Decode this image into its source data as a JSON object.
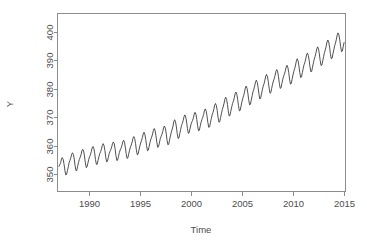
{
  "chart_data": {
    "type": "line",
    "title": "",
    "xlabel": "Time",
    "ylabel": "Y",
    "xlim": [
      1986.9,
      2015.1
    ],
    "ylim": [
      344.0,
      406.5
    ],
    "grid": false,
    "legend": null,
    "x_ticks": [
      1990,
      1995,
      2000,
      2005,
      2010,
      2015
    ],
    "x_tick_labels": [
      "1990",
      "1995",
      "2000",
      "2005",
      "2010",
      "2015"
    ],
    "y_ticks": [
      350,
      360,
      370,
      380,
      390,
      400
    ],
    "y_tick_labels": [
      "350",
      "360",
      "370",
      "380",
      "390",
      "400"
    ],
    "series": [
      {
        "name": "Y",
        "color": "#3d3d3d",
        "x": [
          1987.04,
          1987.12,
          1987.21,
          1987.29,
          1987.37,
          1987.46,
          1987.54,
          1987.62,
          1987.71,
          1987.79,
          1987.87,
          1987.96,
          1988.04,
          1988.12,
          1988.21,
          1988.29,
          1988.37,
          1988.46,
          1988.54,
          1988.62,
          1988.71,
          1988.79,
          1988.87,
          1988.96,
          1989.04,
          1989.12,
          1989.21,
          1989.29,
          1989.37,
          1989.46,
          1989.54,
          1989.62,
          1989.71,
          1989.79,
          1989.87,
          1989.96,
          1990.04,
          1990.12,
          1990.21,
          1990.29,
          1990.37,
          1990.46,
          1990.54,
          1990.62,
          1990.71,
          1990.79,
          1990.87,
          1990.96,
          1991.04,
          1991.12,
          1991.21,
          1991.29,
          1991.37,
          1991.46,
          1991.54,
          1991.62,
          1991.71,
          1991.79,
          1991.87,
          1991.96,
          1992.04,
          1992.12,
          1992.21,
          1992.29,
          1992.37,
          1992.46,
          1992.54,
          1992.62,
          1992.71,
          1992.79,
          1992.87,
          1992.96,
          1993.04,
          1993.12,
          1993.21,
          1993.29,
          1993.37,
          1993.46,
          1993.54,
          1993.62,
          1993.71,
          1993.79,
          1993.87,
          1993.96,
          1994.04,
          1994.12,
          1994.21,
          1994.29,
          1994.37,
          1994.46,
          1994.54,
          1994.62,
          1994.71,
          1994.79,
          1994.87,
          1994.96,
          1995.04,
          1995.12,
          1995.21,
          1995.29,
          1995.37,
          1995.46,
          1995.54,
          1995.62,
          1995.71,
          1995.79,
          1995.87,
          1995.96,
          1996.04,
          1996.12,
          1996.21,
          1996.29,
          1996.37,
          1996.46,
          1996.54,
          1996.62,
          1996.71,
          1996.79,
          1996.87,
          1996.96,
          1997.04,
          1997.12,
          1997.21,
          1997.29,
          1997.37,
          1997.46,
          1997.54,
          1997.62,
          1997.71,
          1997.79,
          1997.87,
          1997.96,
          1998.04,
          1998.12,
          1998.21,
          1998.29,
          1998.37,
          1998.46,
          1998.54,
          1998.62,
          1998.71,
          1998.79,
          1998.87,
          1998.96,
          1999.04,
          1999.12,
          1999.21,
          1999.29,
          1999.37,
          1999.46,
          1999.54,
          1999.62,
          1999.71,
          1999.79,
          1999.87,
          1999.96,
          2000.04,
          2000.12,
          2000.21,
          2000.29,
          2000.37,
          2000.46,
          2000.54,
          2000.62,
          2000.71,
          2000.79,
          2000.87,
          2000.96,
          2001.04,
          2001.12,
          2001.21,
          2001.29,
          2001.37,
          2001.46,
          2001.54,
          2001.62,
          2001.71,
          2001.79,
          2001.87,
          2001.96,
          2002.04,
          2002.12,
          2002.21,
          2002.29,
          2002.37,
          2002.46,
          2002.54,
          2002.62,
          2002.71,
          2002.79,
          2002.87,
          2002.96,
          2003.04,
          2003.12,
          2003.21,
          2003.29,
          2003.37,
          2003.46,
          2003.54,
          2003.62,
          2003.71,
          2003.79,
          2003.87,
          2003.96,
          2004.04,
          2004.12,
          2004.21,
          2004.29,
          2004.37,
          2004.46,
          2004.54,
          2004.62,
          2004.71,
          2004.79,
          2004.87,
          2004.96,
          2005.04,
          2005.12,
          2005.21,
          2005.29,
          2005.37,
          2005.46,
          2005.54,
          2005.62,
          2005.71,
          2005.79,
          2005.87,
          2005.96,
          2006.04,
          2006.12,
          2006.21,
          2006.29,
          2006.37,
          2006.46,
          2006.54,
          2006.62,
          2006.71,
          2006.79,
          2006.87,
          2006.96,
          2007.04,
          2007.12,
          2007.21,
          2007.29,
          2007.37,
          2007.46,
          2007.54,
          2007.62,
          2007.71,
          2007.79,
          2007.87,
          2007.96,
          2008.04,
          2008.12,
          2008.21,
          2008.29,
          2008.37,
          2008.46,
          2008.54,
          2008.62,
          2008.71,
          2008.79,
          2008.87,
          2008.96,
          2009.04,
          2009.12,
          2009.21,
          2009.29,
          2009.37,
          2009.46,
          2009.54,
          2009.62,
          2009.71,
          2009.79,
          2009.87,
          2009.96,
          2010.04,
          2010.12,
          2010.21,
          2010.29,
          2010.37,
          2010.46,
          2010.54,
          2010.62,
          2010.71,
          2010.79,
          2010.87,
          2010.96,
          2011.04,
          2011.12,
          2011.21,
          2011.29,
          2011.37,
          2011.46,
          2011.54,
          2011.62,
          2011.71,
          2011.79,
          2011.87,
          2011.96,
          2012.04,
          2012.12,
          2012.21,
          2012.29,
          2012.37,
          2012.46,
          2012.54,
          2012.62,
          2012.71,
          2012.79,
          2012.87,
          2012.96,
          2013.04,
          2013.12,
          2013.21,
          2013.29,
          2013.37,
          2013.46,
          2013.54,
          2013.62,
          2013.71,
          2013.79,
          2013.87,
          2013.96,
          2014.04,
          2014.12,
          2014.21,
          2014.29,
          2014.37,
          2014.46,
          2014.54,
          2014.62,
          2014.71,
          2014.79,
          2014.87,
          2014.96
        ],
        "values": [
          352.8,
          353.4,
          354.2,
          355.4,
          355.9,
          355.2,
          353.6,
          351.5,
          349.8,
          350.0,
          351.3,
          352.7,
          354.2,
          354.9,
          355.9,
          357.1,
          357.6,
          356.9,
          355.4,
          353.1,
          351.3,
          351.4,
          352.8,
          354.2,
          355.3,
          356.0,
          357.0,
          358.3,
          358.8,
          358.2,
          356.5,
          354.3,
          352.4,
          352.6,
          353.9,
          355.3,
          356.2,
          356.9,
          358.0,
          359.3,
          359.8,
          359.1,
          357.5,
          355.2,
          353.5,
          353.6,
          355.0,
          356.3,
          357.3,
          358.0,
          359.0,
          360.2,
          360.8,
          360.1,
          358.4,
          356.2,
          354.4,
          354.6,
          355.9,
          357.3,
          358.1,
          358.7,
          359.7,
          360.9,
          361.4,
          360.7,
          359.0,
          356.7,
          354.9,
          355.0,
          356.3,
          357.7,
          358.6,
          359.2,
          360.2,
          361.4,
          362.0,
          361.3,
          359.6,
          357.4,
          355.6,
          355.8,
          357.1,
          358.5,
          359.6,
          360.3,
          361.4,
          362.7,
          363.3,
          362.6,
          360.9,
          358.7,
          356.9,
          357.1,
          358.5,
          359.9,
          361.0,
          361.8,
          362.9,
          364.2,
          364.8,
          364.0,
          362.3,
          360.1,
          358.3,
          358.5,
          359.8,
          361.3,
          362.4,
          363.1,
          364.2,
          365.5,
          366.1,
          365.3,
          363.6,
          361.4,
          359.5,
          359.7,
          361.0,
          362.5,
          363.3,
          364.0,
          365.1,
          366.4,
          367.0,
          366.2,
          364.5,
          362.2,
          360.4,
          360.6,
          362.0,
          363.5,
          364.8,
          365.7,
          367.0,
          368.5,
          369.2,
          368.4,
          366.7,
          364.4,
          362.6,
          362.8,
          364.3,
          365.8,
          367.2,
          367.9,
          369.0,
          370.3,
          370.9,
          370.1,
          368.4,
          366.2,
          364.4,
          364.6,
          366.0,
          367.4,
          368.3,
          368.9,
          369.9,
          371.2,
          371.8,
          371.0,
          369.3,
          367.1,
          365.3,
          365.5,
          366.9,
          368.3,
          369.3,
          370.0,
          371.1,
          372.4,
          373.0,
          372.2,
          370.5,
          368.3,
          366.5,
          366.7,
          368.1,
          369.6,
          370.9,
          371.7,
          372.9,
          374.3,
          374.9,
          374.1,
          372.4,
          370.1,
          368.3,
          368.5,
          370.0,
          371.5,
          372.8,
          373.7,
          375.0,
          376.4,
          377.1,
          376.3,
          374.6,
          372.3,
          370.5,
          370.7,
          372.2,
          373.7,
          374.9,
          375.7,
          376.9,
          378.3,
          378.9,
          378.1,
          376.4,
          374.1,
          372.3,
          372.5,
          374.0,
          375.5,
          376.7,
          377.6,
          378.9,
          380.3,
          381.0,
          380.2,
          378.5,
          376.2,
          374.4,
          374.6,
          376.1,
          377.6,
          379.0,
          379.8,
          381.1,
          382.5,
          383.1,
          382.3,
          380.6,
          378.3,
          376.5,
          376.7,
          378.2,
          379.7,
          381.0,
          381.8,
          383.1,
          384.5,
          385.1,
          384.3,
          382.6,
          380.3,
          378.5,
          378.7,
          380.2,
          381.7,
          382.8,
          383.6,
          384.8,
          386.2,
          386.8,
          386.0,
          384.3,
          382.0,
          380.2,
          380.4,
          381.9,
          383.4,
          384.5,
          385.2,
          386.4,
          387.7,
          388.3,
          387.5,
          385.8,
          383.5,
          381.7,
          381.9,
          383.4,
          384.9,
          386.2,
          387.1,
          388.4,
          389.9,
          390.6,
          389.8,
          388.1,
          385.8,
          384.0,
          384.2,
          385.7,
          387.2,
          388.5,
          389.3,
          390.6,
          392.0,
          392.6,
          391.8,
          390.1,
          387.8,
          386.0,
          386.2,
          387.7,
          389.2,
          390.5,
          391.4,
          392.7,
          394.1,
          394.8,
          394.0,
          392.3,
          390.0,
          388.2,
          388.4,
          389.9,
          391.4,
          392.8,
          393.7,
          395.0,
          396.5,
          397.2,
          396.4,
          394.7,
          392.4,
          390.6,
          390.8,
          392.3,
          393.8,
          395.2,
          396.1,
          397.5,
          399.0,
          399.7,
          398.9,
          397.2,
          394.9,
          393.1,
          393.3,
          394.8,
          396.3
        ]
      }
    ]
  }
}
